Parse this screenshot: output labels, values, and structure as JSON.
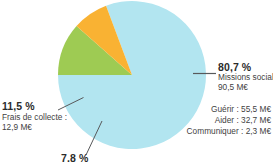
{
  "chart_data": {
    "type": "pie",
    "title": "",
    "currency_unit": "M€",
    "legend_position": "callouts",
    "grid": false,
    "categories": [
      "Missions sociales",
      "Frais de collecte",
      "Frais de fonctionnement"
    ],
    "values": [
      80.7,
      11.5,
      7.8
    ],
    "value_unit": "%",
    "amounts": [
      90.5,
      12.9,
      8.7
    ],
    "colors": [
      "#b2e5f0",
      "#9ecb53",
      "#f9b233"
    ],
    "slices": [
      {
        "label": "Missions sociales",
        "percent_text": "80,7 %",
        "amount_text": "90,5 M€",
        "value": 80.7,
        "color": "#b2e5f0"
      },
      {
        "label": "Frais de collecte :",
        "percent_text": "11,5 %",
        "amount_text": "12,9 M€",
        "value": 11.5,
        "color": "#9ecb53"
      },
      {
        "label": "",
        "percent_text": "7,8 %",
        "amount_text": "",
        "value": 7.8,
        "color": "#f9b233"
      }
    ],
    "sub_breakdown": {
      "parent": "Missions sociales",
      "items": [
        {
          "label": "Guérir",
          "amount_text": "55,5 M€",
          "value": 55.5
        },
        {
          "label": "Aider",
          "amount_text": "32,7 M€",
          "value": 32.7
        },
        {
          "label": "Communiquer",
          "amount_text": "2,3 M€",
          "value": 2.3
        }
      ],
      "rows": [
        "Guérir : 55,5 M€",
        "Aider : 32,7 M€",
        "Communiquer : 2,3 M€"
      ]
    }
  },
  "callouts": {
    "right": {
      "percent": "80,7 %",
      "label": "Missions sociales",
      "amount": "90,5 M€"
    },
    "left": {
      "percent": "11,5 %",
      "label": "Frais de collecte :",
      "amount": "12,9 M€"
    },
    "bottom": {
      "percent": "7,8 %",
      "label": "",
      "amount": ""
    }
  },
  "subitems": {
    "rows": [
      "Guérir : 55,5 M€",
      "Aider : 32,7 M€",
      "Communiquer : 2,3 M€"
    ]
  },
  "style": {
    "slice_blue": "#b2e5f0",
    "slice_green": "#9ecb53",
    "slice_orange": "#f9b233",
    "leader_line": "#58595b",
    "text_color": "#3f3f3f"
  }
}
